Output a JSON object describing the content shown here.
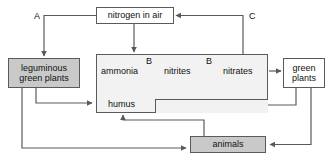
{
  "diagram": {
    "colors": {
      "line": "#5a5a5a",
      "shaded_box": "#c9c9c9",
      "pale_box": "#f2f2f2",
      "plain_box": "#ffffff",
      "text": "#111111",
      "background": "#ffffff"
    },
    "nodes": {
      "nitrogen_in_air": "nitrogen in air",
      "leguminous_green_plants": "leguminous\ngreen plants",
      "green_plants": "green\nplants",
      "animals": "animals",
      "ammonia": "ammonia",
      "nitrites": "nitrites",
      "nitrates": "nitrates",
      "humus": "humus"
    },
    "step_labels": {
      "b_first": "B",
      "b_second": "B"
    },
    "corner_labels": {
      "a": "A",
      "c": "C"
    }
  }
}
